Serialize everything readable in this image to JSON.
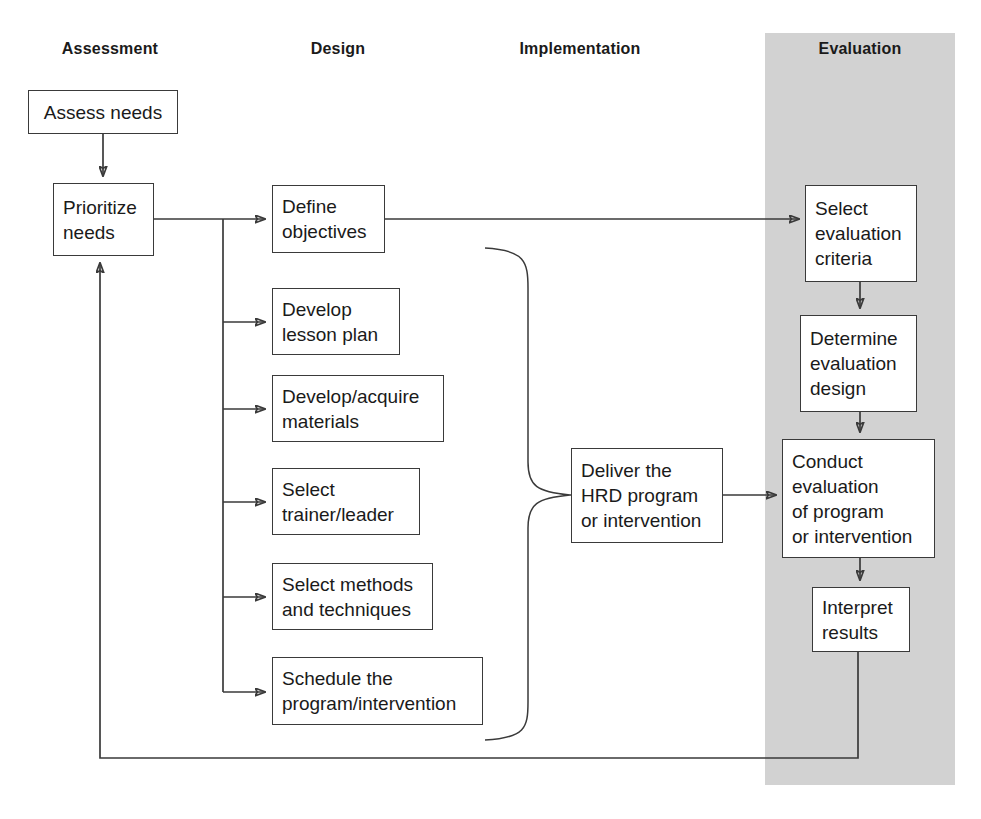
{
  "diagram": {
    "type": "process-flow",
    "bandcolor": "#d2d2d2",
    "linecolor": "#3a3a3a",
    "headers": [
      {
        "label": "Assessment",
        "x": 110
      },
      {
        "label": "Design",
        "x": 338
      },
      {
        "label": "Implementation",
        "x": 580
      },
      {
        "label": "Evaluation",
        "x": 860
      }
    ],
    "phases": {
      "assessment": {
        "label": "Assessment",
        "nodes": [
          {
            "id": "assess-needs",
            "text": "Assess needs",
            "x": 28,
            "y": 90,
            "w": 150,
            "h": 44,
            "align": "center"
          },
          {
            "id": "prioritize-needs",
            "text": "Prioritize\nneeds",
            "x": 53,
            "y": 183,
            "w": 101,
            "h": 73,
            "align": "left"
          }
        ]
      },
      "design": {
        "label": "Design",
        "nodes": [
          {
            "id": "define-objectives",
            "text": "Define\nobjectives",
            "x": 272,
            "y": 185,
            "w": 113,
            "h": 68,
            "align": "left"
          },
          {
            "id": "develop-lesson-plan",
            "text": "Develop\nlesson plan",
            "x": 272,
            "y": 288,
            "w": 128,
            "h": 67,
            "align": "left"
          },
          {
            "id": "develop-materials",
            "text": "Develop/acquire\nmaterials",
            "x": 272,
            "y": 375,
            "w": 172,
            "h": 67,
            "align": "left"
          },
          {
            "id": "select-trainer",
            "text": "Select\ntrainer/leader",
            "x": 272,
            "y": 468,
            "w": 148,
            "h": 67,
            "align": "left"
          },
          {
            "id": "select-methods",
            "text": "Select methods\nand techniques",
            "x": 272,
            "y": 563,
            "w": 161,
            "h": 67,
            "align": "left"
          },
          {
            "id": "schedule-program",
            "text": "Schedule the\nprogram/intervention",
            "x": 272,
            "y": 657,
            "w": 211,
            "h": 68,
            "align": "left"
          }
        ]
      },
      "implementation": {
        "label": "Implementation",
        "nodes": [
          {
            "id": "deliver-hrd-program",
            "text": "Deliver the\nHRD program\nor intervention",
            "x": 571,
            "y": 448,
            "w": 152,
            "h": 95,
            "align": "left"
          }
        ]
      },
      "evaluation": {
        "label": "Evaluation",
        "band": {
          "x": 765,
          "y": 33,
          "w": 190,
          "h": 752
        },
        "nodes": [
          {
            "id": "select-criteria",
            "text": "Select\nevaluation\ncriteria",
            "x": 805,
            "y": 185,
            "w": 112,
            "h": 97,
            "align": "left"
          },
          {
            "id": "determine-design",
            "text": "Determine\nevaluation\ndesign",
            "x": 800,
            "y": 315,
            "w": 117,
            "h": 97,
            "align": "left"
          },
          {
            "id": "conduct-evaluation",
            "text": "Conduct\nevaluation\nof program\nor intervention",
            "x": 782,
            "y": 439,
            "w": 153,
            "h": 119,
            "align": "left"
          },
          {
            "id": "interpret-results",
            "text": "Interpret\nresults",
            "x": 812,
            "y": 587,
            "w": 98,
            "h": 65,
            "align": "left"
          }
        ]
      }
    },
    "connectors": [
      {
        "id": "assess-to-prioritize",
        "from": "assess-needs",
        "to": "prioritize-needs",
        "kind": "arrow-down"
      },
      {
        "id": "prioritize-to-trunk",
        "from": "prioritize-needs",
        "to": "design-trunk",
        "kind": "line-right"
      },
      {
        "id": "trunk-to-define",
        "from": "design-trunk",
        "to": "define-objectives",
        "kind": "arrow-right"
      },
      {
        "id": "trunk-to-lesson-plan",
        "from": "design-trunk",
        "to": "develop-lesson-plan",
        "kind": "arrow-right"
      },
      {
        "id": "trunk-to-materials",
        "from": "design-trunk",
        "to": "develop-materials",
        "kind": "arrow-right"
      },
      {
        "id": "trunk-to-trainer",
        "from": "design-trunk",
        "to": "select-trainer",
        "kind": "arrow-right"
      },
      {
        "id": "trunk-to-methods",
        "from": "design-trunk",
        "to": "select-methods",
        "kind": "arrow-right"
      },
      {
        "id": "trunk-to-schedule",
        "from": "design-trunk",
        "to": "schedule-program",
        "kind": "arrow-right"
      },
      {
        "id": "define-to-criteria",
        "from": "define-objectives",
        "to": "select-criteria",
        "kind": "arrow-right"
      },
      {
        "id": "design-brace",
        "from": "design-nodes",
        "to": "deliver-hrd-program",
        "kind": "brace"
      },
      {
        "id": "deliver-to-conduct",
        "from": "deliver-hrd-program",
        "to": "conduct-evaluation",
        "kind": "arrow-right"
      },
      {
        "id": "criteria-to-determine",
        "from": "select-criteria",
        "to": "determine-design",
        "kind": "arrow-down"
      },
      {
        "id": "determine-to-conduct",
        "from": "determine-design",
        "to": "conduct-evaluation",
        "kind": "arrow-down"
      },
      {
        "id": "conduct-to-interpret",
        "from": "conduct-evaluation",
        "to": "interpret-results",
        "kind": "arrow-down"
      },
      {
        "id": "feedback-loop",
        "from": "interpret-results",
        "to": "prioritize-needs",
        "kind": "arrow-feedback"
      }
    ]
  }
}
